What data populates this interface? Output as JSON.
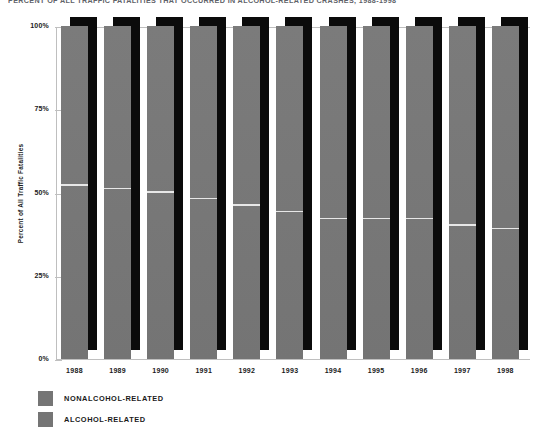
{
  "chart_data": {
    "type": "bar",
    "title": "PERCENT OF ALL TRAFFIC FATALITIES THAT OCCURRED IN ALCOHOL-RELATED CRASHES, 1988-1998",
    "xlabel": "",
    "ylabel": "Percent of All Traffic Fatalities",
    "ylim": [
      0,
      100
    ],
    "grid": false,
    "legend_position": "bottom-left",
    "stacked": true,
    "categories": [
      "1988",
      "1989",
      "1990",
      "1991",
      "1992",
      "1993",
      "1994",
      "1995",
      "1996",
      "1997",
      "1998"
    ],
    "ytick_labels": [
      "100%",
      "75%",
      "50%",
      "25%",
      "0%"
    ],
    "ytick_values": [
      100,
      75,
      50,
      25,
      0
    ],
    "series": [
      {
        "name": "ALCOHOL-RELATED",
        "color": "#757575",
        "values": [
          52,
          51,
          50,
          48,
          46,
          44,
          42,
          42,
          42,
          40,
          39
        ]
      },
      {
        "name": "NONALCOHOL-RELATED",
        "color": "#757575",
        "values": [
          48,
          49,
          50,
          52,
          54,
          56,
          58,
          58,
          58,
          60,
          61
        ]
      }
    ]
  },
  "legend": {
    "items": [
      {
        "label": "NONALCOHOL-RELATED",
        "color": "#757575"
      },
      {
        "label": "ALCOHOL-RELATED",
        "color": "#757575"
      }
    ]
  },
  "colors": {
    "bar": "#757575",
    "shadow": "#0b0b0b",
    "axis": "#bfbfbf",
    "divider": "#e7e7e7",
    "text": "#1a1a1a",
    "title": "#5f6369"
  }
}
